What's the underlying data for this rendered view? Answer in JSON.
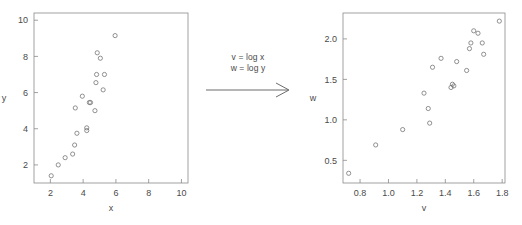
{
  "figure": {
    "title": "",
    "background": "#ffffff",
    "point_color": "#6e6e6e",
    "axis_color": "#8a8a8a",
    "text_color": "#4a4a4a"
  },
  "annotation": {
    "line1": "v = log x",
    "line2": "w = log y",
    "arrow": "rightwards-arrow"
  },
  "chart_data": [
    {
      "type": "scatter",
      "panel": "left",
      "title": "",
      "xlabel": "x",
      "ylabel": "y",
      "xlim": [
        1.0,
        10.4
      ],
      "ylim": [
        1.0,
        10.4
      ],
      "xticks": [
        2,
        4,
        6,
        8,
        10
      ],
      "yticks": [
        2,
        4,
        6,
        8,
        10
      ],
      "xticklabels": [
        "2",
        "4",
        "6",
        "8",
        "10"
      ],
      "yticklabels": [
        "2",
        "4",
        "6",
        "8",
        "10"
      ],
      "grid": false,
      "legend": "none",
      "marker": "open-circle",
      "points": [
        {
          "x": 2.05,
          "y": 1.4
        },
        {
          "x": 2.48,
          "y": 2.0
        },
        {
          "x": 2.9,
          "y": 2.4
        },
        {
          "x": 3.36,
          "y": 2.6
        },
        {
          "x": 3.48,
          "y": 3.1
        },
        {
          "x": 3.62,
          "y": 3.75
        },
        {
          "x": 3.52,
          "y": 5.15
        },
        {
          "x": 3.95,
          "y": 5.8
        },
        {
          "x": 4.22,
          "y": 4.05
        },
        {
          "x": 4.22,
          "y": 3.9
        },
        {
          "x": 4.38,
          "y": 5.45
        },
        {
          "x": 4.45,
          "y": 5.45
        },
        {
          "x": 4.72,
          "y": 5.0
        },
        {
          "x": 4.78,
          "y": 6.55
        },
        {
          "x": 4.82,
          "y": 7.0
        },
        {
          "x": 4.86,
          "y": 8.2
        },
        {
          "x": 5.05,
          "y": 7.9
        },
        {
          "x": 5.22,
          "y": 6.15
        },
        {
          "x": 5.3,
          "y": 7.0
        },
        {
          "x": 5.95,
          "y": 9.15
        }
      ]
    },
    {
      "type": "scatter",
      "panel": "right",
      "title": "",
      "xlabel": "v",
      "ylabel": "w",
      "xlim": [
        0.68,
        1.82
      ],
      "ylim": [
        0.22,
        2.32
      ],
      "xticks": [
        0.8,
        1.0,
        1.2,
        1.4,
        1.6,
        1.8
      ],
      "yticks": [
        0.5,
        1.0,
        1.5,
        2.0
      ],
      "xticklabels": [
        "0.8",
        "1.0",
        "1.2",
        "1.4",
        "1.6",
        "1.8"
      ],
      "yticklabels": [
        "0.5",
        "1.0",
        "1.5",
        "2.0"
      ],
      "grid": false,
      "legend": "none",
      "marker": "open-circle",
      "points": [
        {
          "v": 0.72,
          "w": 0.34
        },
        {
          "v": 0.91,
          "w": 0.69
        },
        {
          "v": 1.1,
          "w": 0.88
        },
        {
          "v": 1.25,
          "w": 1.33
        },
        {
          "v": 1.28,
          "w": 1.14
        },
        {
          "v": 1.29,
          "w": 0.96
        },
        {
          "v": 1.31,
          "w": 1.65
        },
        {
          "v": 1.37,
          "w": 1.76
        },
        {
          "v": 1.44,
          "w": 1.4
        },
        {
          "v": 1.45,
          "w": 1.44
        },
        {
          "v": 1.46,
          "w": 1.42
        },
        {
          "v": 1.48,
          "w": 1.72
        },
        {
          "v": 1.55,
          "w": 1.61
        },
        {
          "v": 1.57,
          "w": 1.88
        },
        {
          "v": 1.58,
          "w": 1.95
        },
        {
          "v": 1.6,
          "w": 2.1
        },
        {
          "v": 1.63,
          "w": 2.07
        },
        {
          "v": 1.66,
          "w": 1.95
        },
        {
          "v": 1.67,
          "w": 1.81
        },
        {
          "v": 1.78,
          "w": 2.22
        }
      ]
    }
  ]
}
